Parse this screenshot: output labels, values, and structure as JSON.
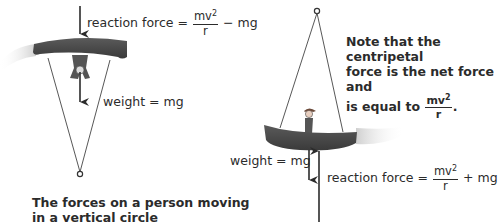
{
  "left_figure": {
    "reaction_label": "reaction force =",
    "reaction_frac_num": "mv",
    "reaction_frac_sup": "2",
    "reaction_frac_den": "r",
    "reaction_suffix": "− mg",
    "weight_label": "weight = mg",
    "caption_line1": "The forces on a person moving",
    "caption_line2": "in a vertical circle"
  },
  "right_figure": {
    "note_line1": "Note that the centripetal",
    "note_line2": "force is the net force and",
    "note_line3_prefix": "is equal to",
    "note_frac_num": "mv",
    "note_frac_sup": "2",
    "note_frac_den": "r",
    "note_suffix": ".",
    "weight_label": "weight = mg",
    "reaction_label": "reaction force =",
    "reaction_frac_num": "mv",
    "reaction_frac_sup": "2",
    "reaction_frac_den": "r",
    "reaction_suffix": "+ mg"
  },
  "colors": {
    "swing_seat": "#4a4a4a",
    "arrow": "#2b2b2b",
    "motion_blur": "#d8d8d8"
  }
}
